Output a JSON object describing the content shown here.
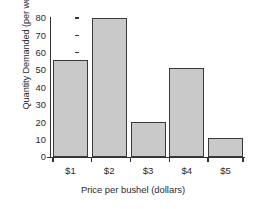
{
  "chart_data": {
    "type": "bar",
    "title": "",
    "xlabel": "Price per bushel (dollars)",
    "ylabel": "Quantity Demanded (per week)",
    "categories": [
      "$1",
      "$2",
      "$3",
      "$4",
      "$5"
    ],
    "values": [
      56,
      80,
      20,
      51,
      11
    ],
    "series": [
      {
        "name": "Quantity Demanded",
        "values": [
          56,
          80,
          20,
          51,
          11
        ]
      }
    ],
    "ylim": [
      0,
      80
    ],
    "xlim": [
      0,
      5
    ],
    "y_ticks": [
      0,
      10,
      20,
      30,
      40,
      50,
      60,
      70,
      80
    ],
    "y_tick_labels": [
      "0",
      "10",
      "20",
      "30",
      "40",
      "50",
      "60",
      "70",
      "80"
    ],
    "x_tick_labels": [
      "$1",
      "$2",
      "$3",
      "$4",
      "$5"
    ],
    "grid": false,
    "legend": false,
    "legend_position": "none",
    "bar_fill_color": "#c9c9c9",
    "bar_edge_color": "#3a3a3a",
    "axis_color": "#333333",
    "background_color": "#ffffff"
  }
}
